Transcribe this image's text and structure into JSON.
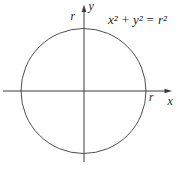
{
  "figure": {
    "equation": "x² + y² = r²",
    "y_axis_label": "y",
    "x_axis_label": "x",
    "radius_label_top": "r",
    "radius_label_right": "r",
    "colors": {
      "axis": "#3c3c3c",
      "circle": "#4f4f4f",
      "text": "#242424",
      "background": "#ffffff"
    }
  }
}
